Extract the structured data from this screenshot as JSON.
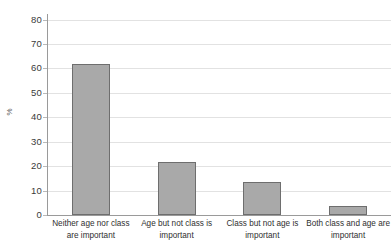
{
  "chart_data": {
    "type": "bar",
    "title": "",
    "subtitle": "",
    "xlabel": "",
    "ylabel": "%",
    "ylim": [
      0,
      80
    ],
    "ytick_interval": 10,
    "ytick_labels": [
      "80",
      "70",
      "60",
      "50",
      "40",
      "30",
      "20",
      "10",
      "0"
    ],
    "grid": true,
    "grid_axis": "y",
    "legend": false,
    "legend_position": "none",
    "bar_fill_color": "#a9a9a9",
    "bar_border_color": "#6e6e6e",
    "axis_color": "#9a9a9a",
    "gridline_color": "#e2e2e2",
    "text_color": "#2f2f2f",
    "top_label_clipped": "80",
    "categories": [
      "Neither age nor class are important",
      "Age but not class is important",
      "Class but not age is important",
      "Both class and age are important"
    ],
    "category_lines": [
      [
        "Neither age nor class",
        "are important"
      ],
      [
        "Age but not class is",
        "important"
      ],
      [
        "Class but not age is",
        "important"
      ],
      [
        "Both class and age are",
        "important"
      ]
    ],
    "values": [
      62,
      21.5,
      13.5,
      3.5
    ]
  }
}
